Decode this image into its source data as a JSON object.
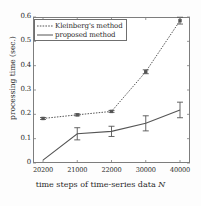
{
  "chart_data": {
    "type": "line",
    "title": "",
    "xlabel": "time steps of time-series data N",
    "ylabel": "processing time (sec.)",
    "categories": [
      "20200",
      "21000",
      "22000",
      "30000",
      "40000"
    ],
    "x_tick_labels": [
      "20200",
      "21000",
      "22000",
      "30000",
      "40000"
    ],
    "y_tick_labels": [
      "0",
      "0.1",
      "0.2",
      "0.3",
      "0.4",
      "0.5",
      "0.6"
    ],
    "y_tick_values": [
      0,
      0.1,
      0.2,
      0.3,
      0.4,
      0.5,
      0.6
    ],
    "ylim": [
      0,
      0.6
    ],
    "grid": false,
    "legend_position": "upper left",
    "series": [
      {
        "name": "Kleinberg's method",
        "style": "dotted",
        "marker": "square",
        "color": "#555555",
        "values": [
          0.183,
          0.198,
          0.212,
          0.375,
          0.585
        ],
        "errors": [
          0.004,
          0.004,
          0.004,
          0.008,
          0.014
        ]
      },
      {
        "name": "proposed method",
        "style": "solid",
        "marker": "none",
        "color": "#555555",
        "values": [
          0.012,
          0.12,
          0.13,
          0.163,
          0.218
        ],
        "errors": [
          0.0,
          0.025,
          0.021,
          0.031,
          0.032
        ]
      }
    ]
  },
  "legend": {
    "entries": [
      {
        "label": "Kleinberg's method",
        "style": "dotted"
      },
      {
        "label": "proposed method",
        "style": "solid"
      }
    ]
  },
  "axis_title": {
    "x_prefix": "time steps of time-series data ",
    "x_variable": "N",
    "y": "processing time (sec.)"
  }
}
